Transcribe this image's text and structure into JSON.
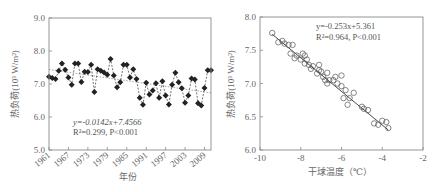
{
  "chart_data": [
    {
      "type": "line",
      "title": "",
      "xlabel": "年份",
      "ylabel": "热负荷(10³ W/m²)",
      "xlim": [
        1961,
        2011
      ],
      "ylim": [
        5.0,
        9.0
      ],
      "xticks": [
        "1961",
        "1967",
        "1973",
        "1979",
        "1985",
        "1991",
        "1997",
        "2003",
        "2009"
      ],
      "yticks": [
        "5.0",
        "6.0",
        "7.0",
        "8.0",
        "9.0"
      ],
      "grid": false,
      "series": [
        {
          "name": "热负荷",
          "marker": "filled-diamond",
          "linestyle": "dashed",
          "x": [
            1961,
            1962,
            1963,
            1964,
            1965,
            1966,
            1967,
            1968,
            1969,
            1970,
            1971,
            1972,
            1973,
            1974,
            1975,
            1976,
            1977,
            1978,
            1979,
            1980,
            1981,
            1982,
            1983,
            1984,
            1985,
            1986,
            1987,
            1988,
            1989,
            1990,
            1991,
            1992,
            1993,
            1994,
            1995,
            1996,
            1997,
            1998,
            1999,
            2000,
            2001,
            2002,
            2003,
            2004,
            2005,
            2006,
            2007,
            2008,
            2009,
            2010,
            2011
          ],
          "values": [
            7.22,
            7.18,
            7.15,
            7.4,
            7.62,
            7.43,
            7.2,
            6.98,
            7.62,
            7.62,
            7.06,
            7.37,
            7.36,
            7.58,
            6.76,
            7.45,
            7.4,
            7.35,
            7.28,
            7.76,
            7.26,
            6.9,
            7.05,
            7.58,
            7.58,
            7.2,
            7.45,
            7.15,
            6.58,
            6.37,
            7.04,
            6.68,
            6.8,
            7.02,
            6.58,
            7.08,
            6.65,
            6.38,
            6.98,
            7.34,
            7.05,
            6.87,
            6.43,
            6.65,
            7.17,
            7.14,
            6.42,
            6.35,
            6.88,
            7.42,
            7.42
          ]
        },
        {
          "name": "trend",
          "type": "line",
          "linestyle": "dotted",
          "equation": "y=-0.0142x+7.4566",
          "x": [
            1961,
            2011
          ],
          "values": [
            7.44,
            6.73
          ]
        }
      ],
      "annotations": [
        "y=-0.0142x+7.4566",
        "R²=0.299, P<0.001"
      ]
    },
    {
      "type": "scatter",
      "title": "",
      "xlabel": "干球温度（℃）",
      "ylabel": "热负荷(10³ W/m²)",
      "xlim": [
        -10,
        -2
      ],
      "ylim": [
        6.0,
        8.0
      ],
      "xticks": [
        "-10",
        "-8",
        "-6",
        "-4",
        "-2"
      ],
      "yticks": [
        "6.0",
        "6.5",
        "7.0",
        "7.5",
        "8.0"
      ],
      "grid": false,
      "series": [
        {
          "name": "observations",
          "marker": "open-circle",
          "x": [
            -9.4,
            -9.1,
            -8.9,
            -8.8,
            -8.6,
            -8.5,
            -8.4,
            -8.3,
            -8.2,
            -8.0,
            -7.9,
            -7.8,
            -7.8,
            -7.7,
            -7.6,
            -7.5,
            -7.4,
            -7.2,
            -7.1,
            -7.1,
            -7.0,
            -6.9,
            -6.8,
            -6.7,
            -6.7,
            -6.6,
            -6.4,
            -6.3,
            -6.2,
            -6.0,
            -6.0,
            -5.9,
            -5.8,
            -5.7,
            -5.6,
            -5.4,
            -5.0,
            -4.9,
            -4.7,
            -4.4,
            -4.2,
            -4.0,
            -3.8,
            -3.7
          ],
          "values": [
            7.76,
            7.62,
            7.64,
            7.6,
            7.58,
            7.45,
            7.58,
            7.38,
            7.42,
            7.36,
            7.45,
            7.42,
            7.3,
            7.36,
            7.28,
            7.22,
            7.26,
            7.15,
            7.28,
            7.2,
            7.18,
            7.1,
            7.05,
            7.16,
            7.0,
            7.05,
            7.05,
            7.1,
            7.0,
            7.12,
            6.96,
            6.78,
            6.9,
            6.68,
            6.78,
            6.86,
            6.65,
            6.62,
            6.6,
            6.4,
            6.38,
            6.44,
            6.42,
            6.33
          ]
        },
        {
          "name": "fit",
          "type": "line",
          "linestyle": "solid",
          "equation": "y=-0.253x+5.361",
          "x": [
            -9.4,
            -3.7
          ],
          "values": [
            7.74,
            6.3
          ]
        }
      ],
      "annotations": [
        "y=-0.253x+5.361",
        "R²=0.964, P<0.001"
      ]
    }
  ],
  "left": {
    "ylabel": "热负荷(10³ W/m²)",
    "xlabel": "年份",
    "eq_line1": "y=-0.0142x+7.4566",
    "eq_line2": "R²=0.299, P<0.001"
  },
  "right": {
    "ylabel": "热负荷(10³ W/m²)",
    "xlabel": "干球温度（℃）",
    "eq_line1": "y=-0.253x+5.361",
    "eq_line2": "R²=0.964, P<0.001"
  },
  "colors": {
    "axis": "#888888",
    "marker": "#222222",
    "text": "#666666"
  }
}
